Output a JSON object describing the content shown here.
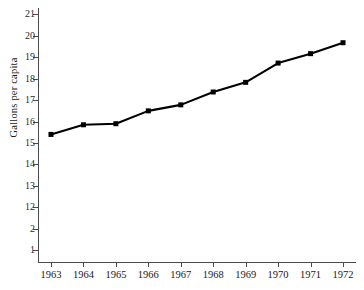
{
  "chart_data": {
    "type": "line",
    "title": "",
    "xlabel": "",
    "ylabel": "Gallons per capita",
    "categories": [
      "1963",
      "1964",
      "1965",
      "1966",
      "1967",
      "1968",
      "1969",
      "1970",
      "1971",
      "1972"
    ],
    "x": [
      1963,
      1964,
      1965,
      1966,
      1967,
      1968,
      1969,
      1970,
      1971,
      1972
    ],
    "values": [
      15.4,
      15.85,
      15.9,
      16.5,
      16.78,
      17.38,
      17.83,
      18.73,
      19.17,
      19.68
    ],
    "series": [
      {
        "name": "Gallons per capita",
        "values": [
          15.4,
          15.85,
          15.9,
          16.5,
          16.78,
          17.38,
          17.83,
          18.73,
          19.17,
          19.68
        ]
      }
    ],
    "xlim": [
      1962.6,
      1972.4
    ],
    "ylim": [
      9.4,
      21.3
    ],
    "y_ticks": [
      21,
      20,
      19,
      18,
      17,
      16,
      15,
      14,
      13,
      12,
      11,
      10
    ],
    "y_tick_labels": [
      "21",
      "20",
      "19",
      "18",
      "17",
      "16",
      "15",
      "14",
      "13",
      "12",
      "2",
      "1"
    ],
    "x_ticks": [
      1963,
      1964,
      1965,
      1966,
      1967,
      1968,
      1969,
      1970,
      1971,
      1972
    ],
    "x_tick_labels": [
      "1963",
      "1964",
      "1965",
      "1966",
      "1967",
      "1968",
      "1969",
      "1970",
      "1971",
      "1972"
    ],
    "grid": false,
    "legend": false,
    "legend_position": "none",
    "marker": "square",
    "line_color": "#000000",
    "marker_color": "#000000",
    "axis_color": "#4a4a4a",
    "background_color": "#ffffff"
  }
}
